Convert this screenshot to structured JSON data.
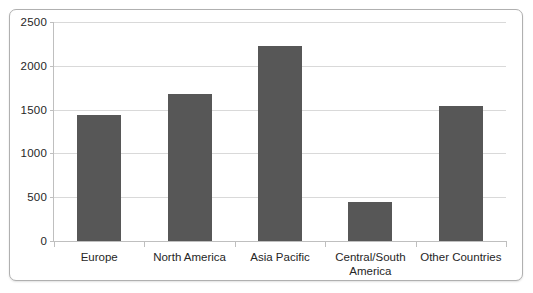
{
  "chart_data": {
    "type": "bar",
    "title": "",
    "subtitle": "",
    "xlabel": "",
    "ylabel": "",
    "categories": [
      "Europe",
      "North America",
      "Asia Pacific",
      "Central/South\nAmerica",
      "Other Countries"
    ],
    "values": [
      1440,
      1680,
      2230,
      440,
      1540
    ],
    "ylim": [
      0,
      2500
    ],
    "ytick_labels": [
      "0",
      "500",
      "1000",
      "1500",
      "2000",
      "2500"
    ],
    "ytick_values": [
      0,
      500,
      1000,
      1500,
      2000,
      2500
    ],
    "grid": true,
    "legend": false,
    "legend_position": "none",
    "series": [
      {
        "name": "",
        "color": "#575757",
        "values": [
          1440,
          1680,
          2230,
          440,
          1540
        ]
      }
    ],
    "annotations": []
  },
  "style": {
    "bar_color": "#575757",
    "gridline_color": "#d9d9d9",
    "axis_color": "#bfbfbf",
    "frame_border_color": "#b0b0b0",
    "text_color": "#262626",
    "background": "#ffffff"
  }
}
